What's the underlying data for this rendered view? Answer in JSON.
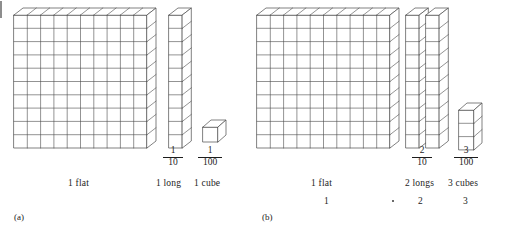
{
  "figure": {
    "stroke_color": "#4a4a4a",
    "fill_color": "#ffffff",
    "panels": [
      {
        "tag": "(a)",
        "pieces": [
          {
            "name": "flat",
            "label": "1 flat",
            "fraction": null,
            "value": null,
            "count": 1,
            "shape": "flat-10x10"
          },
          {
            "name": "long",
            "label": "1 long",
            "fraction": {
              "numerator": "1",
              "denominator": "10"
            },
            "value": null,
            "count": 1,
            "shape": "long-1x10"
          },
          {
            "name": "cube",
            "label": "1 cube",
            "fraction": {
              "numerator": "1",
              "denominator": "100"
            },
            "value": null,
            "count": 1,
            "shape": "cube-1x1"
          }
        ]
      },
      {
        "tag": "(b)",
        "pieces": [
          {
            "name": "flat",
            "label": "1 flat",
            "fraction": null,
            "value": "1",
            "count": 1,
            "shape": "flat-10x10"
          },
          {
            "name": "longs",
            "label": "2 longs",
            "fraction": {
              "numerator": "2",
              "denominator": "10"
            },
            "value": "2",
            "count": 2,
            "shape": "long-1x10"
          },
          {
            "name": "cubes",
            "label": "3 cubes",
            "fraction": {
              "numerator": "3",
              "denominator": "100"
            },
            "value": "3",
            "count": 3,
            "shape": "cube-stack-3"
          }
        ]
      }
    ],
    "artifacts": {
      "left_edge_mark": true,
      "stray_dot": true
    }
  }
}
